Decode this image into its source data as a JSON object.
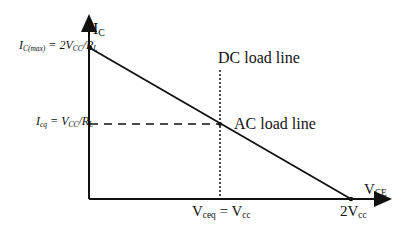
{
  "diagram": {
    "type": "transistor-load-line",
    "axes": {
      "y_label": {
        "main": "I",
        "sub": "C"
      },
      "x_label": {
        "main": "V",
        "sub": "CE"
      }
    },
    "y_ticks": {
      "top": {
        "lhs": "I",
        "lhs_sub": "C(max)",
        "rhs": " = 2V",
        "rhs_sub": "CC",
        "tail": "/R",
        "tail_sub": "L"
      },
      "mid": {
        "lhs": "I",
        "lhs_sub": "cq",
        "rhs": " = V",
        "rhs_sub": "CC",
        "tail": "/R",
        "tail_sub": "L"
      }
    },
    "x_ticks": {
      "mid": {
        "a": "V",
        "a_sub": "ceq",
        "b": " = V",
        "b_sub": "cc"
      },
      "end": {
        "a": "2V",
        "a_sub": "cc"
      }
    },
    "annotations": {
      "dc_line": "DC load line",
      "ac_line": "AC load line"
    },
    "colors": {
      "line": "#111111",
      "background": "#ffffff"
    }
  }
}
